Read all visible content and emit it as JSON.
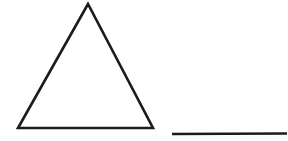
{
  "canvas": {
    "width": 141,
    "height": 141,
    "background": "#ffffff",
    "description": "Black-and-white line drawing: an outlined triangle on the left and a horizontal line segment at the lower right"
  },
  "figure": {
    "stroke_color": "#1b1b1b",
    "triangle": {
      "points": "88,4 18,128 153,128",
      "stroke_width": "2.6",
      "fill": "none",
      "linejoin": "miter"
    },
    "line_segment": {
      "x1": "172",
      "y1": "134",
      "x2": "287",
      "y2": "133.5",
      "stroke_width": "2.4",
      "linecap": "butt"
    }
  }
}
